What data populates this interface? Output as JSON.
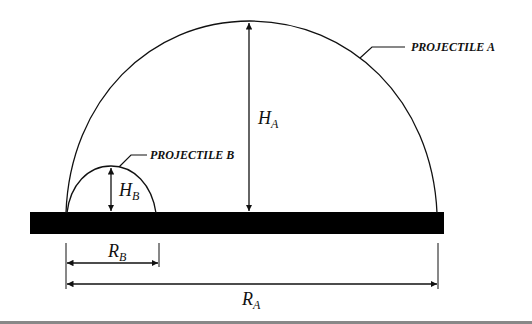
{
  "diagram": {
    "labels": {
      "projectile_a": "PROJECTILE A",
      "projectile_b": "PROJECTILE B"
    },
    "symbols": {
      "ha": {
        "main": "H",
        "sub": "A"
      },
      "hb": {
        "main": "H",
        "sub": "B"
      },
      "ra": {
        "main": "R",
        "sub": "A"
      },
      "rb": {
        "main": "R",
        "sub": "B"
      }
    },
    "colors": {
      "ink": "#111111",
      "ground": "#000000",
      "footer_line": "#888888"
    }
  }
}
